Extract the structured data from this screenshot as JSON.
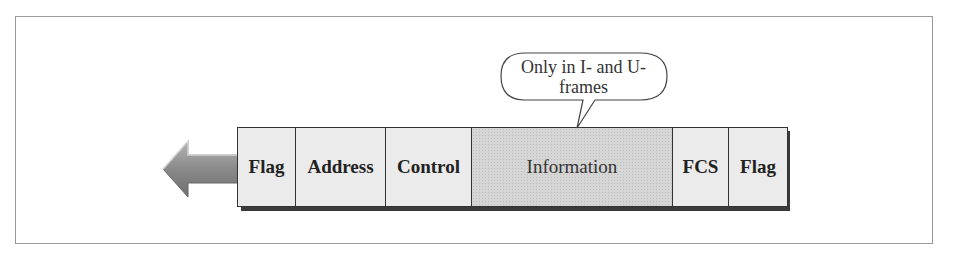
{
  "diagram": {
    "callout": {
      "line1": "Only in I- and U-",
      "line2": "frames",
      "points_to": "Information"
    },
    "direction_arrow": "left",
    "fields": [
      {
        "label": "Flag",
        "width": 58,
        "bold": true
      },
      {
        "label": "Address",
        "width": 90,
        "bold": true
      },
      {
        "label": "Control",
        "width": 86,
        "bold": true
      },
      {
        "label": "Information",
        "width": 201,
        "bold": false,
        "highlighted": true
      },
      {
        "label": "FCS",
        "width": 56,
        "bold": true
      },
      {
        "label": "Flag",
        "width": 58,
        "bold": true
      }
    ],
    "colors": {
      "field_fill": "#ebebeb",
      "info_fill": "#d6d6d6",
      "arrow_fill": "#8c8c8c",
      "border": "#333333",
      "shadow": "#3a3a3a"
    }
  }
}
